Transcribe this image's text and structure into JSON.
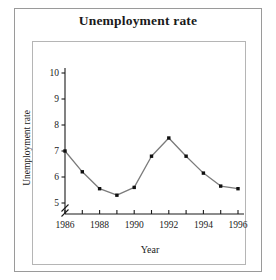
{
  "chart_data": {
    "type": "line",
    "title": "Unemployment rate",
    "xlabel": "Year",
    "ylabel": "Unemployment rate",
    "x": [
      1986,
      1987,
      1988,
      1989,
      1990,
      1991,
      1992,
      1993,
      1994,
      1995,
      1996
    ],
    "values": [
      7.0,
      6.2,
      5.55,
      5.3,
      5.6,
      6.8,
      7.5,
      6.8,
      6.15,
      5.65,
      5.55
    ],
    "xlim": [
      1986,
      1996
    ],
    "ylim": [
      5,
      10
    ],
    "y_ticks": [
      5,
      6,
      7,
      8,
      9,
      10
    ],
    "y_tick_labels": [
      "5",
      "6",
      "7",
      "8",
      "9",
      "10"
    ],
    "x_ticks": [
      1986,
      1987,
      1988,
      1989,
      1990,
      1991,
      1992,
      1993,
      1994,
      1995,
      1996
    ],
    "x_tick_labels": [
      "1986",
      "",
      "1988",
      "",
      "1990",
      "",
      "1992",
      "",
      "1994",
      "",
      "1996"
    ],
    "y_axis_break": true,
    "grid": false,
    "legend": null,
    "marker": "square",
    "marker_color": "#101010",
    "line_color": "#7b7b7b",
    "axis_color": "#1a1a1a",
    "frame_color": "#b5b5b5",
    "outer_frame_color": "#9a9a9a",
    "background": "#ffffff"
  }
}
